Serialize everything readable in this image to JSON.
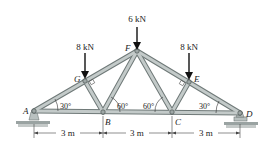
{
  "diagram": {
    "type": "roof truss",
    "joints": [
      {
        "id": "A",
        "label": "A",
        "x": 34,
        "y": 111
      },
      {
        "id": "B",
        "label": "B",
        "x": 103,
        "y": 112
      },
      {
        "id": "C",
        "label": "C",
        "x": 172,
        "y": 112
      },
      {
        "id": "D",
        "label": "D",
        "x": 240,
        "y": 113
      },
      {
        "id": "E",
        "label": "E",
        "x": 189,
        "y": 82
      },
      {
        "id": "F",
        "label": "F",
        "x": 137,
        "y": 51
      },
      {
        "id": "G",
        "label": "G",
        "x": 85,
        "y": 81
      }
    ],
    "members": [
      [
        "A",
        "B"
      ],
      [
        "B",
        "C"
      ],
      [
        "C",
        "D"
      ],
      [
        "A",
        "G"
      ],
      [
        "G",
        "F"
      ],
      [
        "F",
        "E"
      ],
      [
        "E",
        "D"
      ],
      [
        "G",
        "B"
      ],
      [
        "B",
        "F"
      ],
      [
        "F",
        "C"
      ],
      [
        "C",
        "E"
      ]
    ],
    "loads": [
      {
        "joint": "G",
        "label": "8 kN"
      },
      {
        "joint": "F",
        "label": "6 kN"
      },
      {
        "joint": "E",
        "label": "8 kN"
      }
    ],
    "angles": [
      {
        "label": "30°",
        "at": "A"
      },
      {
        "label": "60°",
        "at": "B"
      },
      {
        "label": "60°",
        "at": "C"
      },
      {
        "label": "30°",
        "at": "D"
      }
    ],
    "dimensions": [
      {
        "label": "3 m",
        "from": "A",
        "to": "B"
      },
      {
        "label": "3 m",
        "from": "B",
        "to": "C"
      },
      {
        "label": "3 m",
        "from": "C",
        "to": "D"
      }
    ],
    "supports": [
      {
        "joint": "A",
        "type": "pin"
      },
      {
        "joint": "D",
        "type": "roller"
      }
    ]
  }
}
